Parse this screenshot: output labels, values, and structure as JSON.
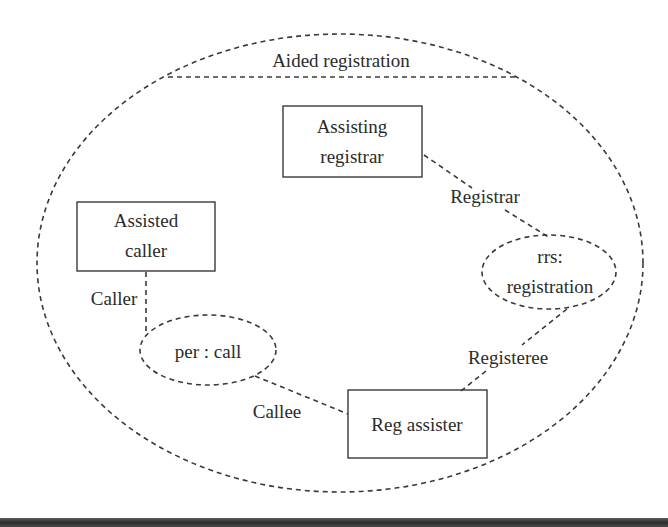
{
  "diagram": {
    "type": "collaboration",
    "title": "Aided registration",
    "colors": {
      "stroke": "#3a3a3a",
      "text": "#2b2b2b",
      "bar": "#3a3a3a"
    },
    "boxes": [
      {
        "id": "assisting-registrar",
        "lines": [
          "Assisting",
          "registrar"
        ]
      },
      {
        "id": "assisted-caller",
        "lines": [
          "Assisted",
          "caller"
        ]
      },
      {
        "id": "reg-assister",
        "lines": [
          "Reg assister"
        ]
      }
    ],
    "ellipses": [
      {
        "id": "rrs-registration",
        "lines": [
          "rrs:",
          "registration"
        ]
      },
      {
        "id": "per-call",
        "lines": [
          "per : call"
        ]
      }
    ],
    "roles": {
      "registrar": "Registrar",
      "caller": "Caller",
      "registeree": "Registeree",
      "callee": "Callee"
    },
    "connections": [
      {
        "from": "assisting-registrar",
        "to": "rrs-registration",
        "role": "Registrar"
      },
      {
        "from": "assisted-caller",
        "to": "per-call",
        "role": "Caller"
      },
      {
        "from": "reg-assister",
        "to": "rrs-registration",
        "role": "Registeree"
      },
      {
        "from": "reg-assister",
        "to": "per-call",
        "role": "Callee"
      }
    ]
  }
}
